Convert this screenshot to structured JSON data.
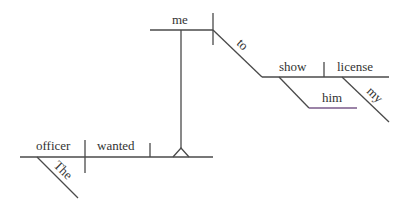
{
  "diagram": {
    "type": "sentence-diagram",
    "sentence_words": {
      "subject": "officer",
      "subject_modifier": "The",
      "verb": "wanted",
      "infinitive_subject": "me",
      "infinitive_marker": "to",
      "infinitive_verb": "show",
      "indirect_object": "him",
      "direct_object": "license",
      "direct_object_modifier": "my"
    },
    "colors": {
      "line": "#4a4a4a",
      "indirect_object_line": "#7a5a8a",
      "text": "#333333",
      "background": "#ffffff"
    }
  }
}
